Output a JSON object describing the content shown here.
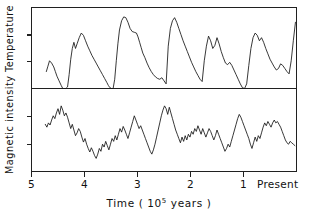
{
  "figure": {
    "background_color": "#ffffff",
    "line_color": "#151515",
    "axis_color": "#202020"
  },
  "axes": {
    "ylabel": "Magnetic intensity  Temperature",
    "ylabel_parts": {
      "lower_panel": "Magnetic intensity",
      "upper_panel": "Temperature"
    },
    "xlabel_prefix": "Time ( 10",
    "xlabel_exponent": "5",
    "xlabel_suffix": " years )",
    "xlabel_full": "Time ( 10^5 years )",
    "xticklabels": [
      "5",
      "4",
      "3",
      "2",
      "1",
      "Present"
    ],
    "xtickvalues": [
      5,
      4,
      3,
      2,
      1,
      0
    ],
    "x_direction": "decreasing-left-to-right",
    "yticks_count_upper": 2,
    "yticks_count_lower": 2,
    "ytick_labels": []
  },
  "chart_data": {
    "type": "line",
    "title": "",
    "subtitle": "",
    "xlabel": "Time ( 10^5 years )",
    "ylabel": "Magnetic intensity  Temperature",
    "xlim": [
      5.0,
      0.0
    ],
    "grid": false,
    "legend": "none",
    "panels": [
      {
        "name": "temperature",
        "label": "Temperature",
        "position": "top",
        "ylabel": "Temperature",
        "ylim": [
          0,
          1
        ],
        "yticks": [
          0.33,
          0.66
        ],
        "ytick_labels": [],
        "units": "relative (arbitrary)",
        "series": [
          {
            "name": "Temperature",
            "x": [
              4.72,
              4.69,
              4.66,
              4.62,
              4.58,
              4.55,
              4.52,
              4.48,
              4.44,
              4.41,
              4.38,
              4.35,
              4.32,
              4.29,
              4.26,
              4.23,
              4.2,
              4.17,
              4.14,
              4.1,
              4.06,
              4.02,
              3.98,
              3.94,
              3.9,
              3.86,
              3.82,
              3.78,
              3.74,
              3.7,
              3.66,
              3.62,
              3.58,
              3.55,
              3.52,
              3.49,
              3.46,
              3.43,
              3.4,
              3.37,
              3.34,
              3.3,
              3.26,
              3.22,
              3.18,
              3.14,
              3.1,
              3.06,
              3.02,
              2.99,
              2.96,
              2.93,
              2.9,
              2.86,
              2.82,
              2.78,
              2.74,
              2.7,
              2.66,
              2.62,
              2.58,
              2.54,
              2.5,
              2.46,
              2.42,
              2.38,
              2.34,
              2.3,
              2.26,
              2.22,
              2.18,
              2.14,
              2.1,
              2.06,
              2.02,
              1.98,
              1.94,
              1.9,
              1.86,
              1.82,
              1.78,
              1.74,
              1.7,
              1.66,
              1.62,
              1.58,
              1.54,
              1.5,
              1.46,
              1.42,
              1.38,
              1.34,
              1.3,
              1.26,
              1.22,
              1.18,
              1.14,
              1.1,
              1.06,
              1.02,
              0.98,
              0.94,
              0.9,
              0.86,
              0.82,
              0.78,
              0.74,
              0.7,
              0.66,
              0.62,
              0.58,
              0.54,
              0.5,
              0.46,
              0.42,
              0.38,
              0.34,
              0.3,
              0.26,
              0.22,
              0.18,
              0.14,
              0.1,
              0.06,
              0.02
            ],
            "y": [
              0.22,
              0.29,
              0.36,
              0.33,
              0.28,
              0.22,
              0.16,
              0.1,
              0.04,
              0.0,
              0.0,
              0.0,
              0.02,
              0.18,
              0.38,
              0.52,
              0.6,
              0.52,
              0.58,
              0.66,
              0.72,
              0.69,
              0.62,
              0.55,
              0.49,
              0.43,
              0.38,
              0.33,
              0.28,
              0.23,
              0.18,
              0.13,
              0.08,
              0.04,
              0.01,
              0.0,
              0.0,
              0.12,
              0.36,
              0.58,
              0.76,
              0.88,
              0.93,
              0.92,
              0.86,
              0.78,
              0.74,
              0.73,
              0.72,
              0.67,
              0.6,
              0.53,
              0.46,
              0.4,
              0.33,
              0.27,
              0.22,
              0.18,
              0.15,
              0.13,
              0.12,
              0.14,
              0.1,
              0.06,
              0.55,
              0.78,
              0.88,
              0.92,
              0.86,
              0.78,
              0.7,
              0.62,
              0.55,
              0.48,
              0.41,
              0.34,
              0.28,
              0.22,
              0.17,
              0.12,
              0.09,
              0.36,
              0.55,
              0.68,
              0.62,
              0.52,
              0.56,
              0.66,
              0.58,
              0.48,
              0.4,
              0.33,
              0.31,
              0.34,
              0.3,
              0.24,
              0.18,
              0.12,
              0.06,
              0.01,
              0.0,
              0.06,
              0.3,
              0.52,
              0.66,
              0.72,
              0.69,
              0.62,
              0.66,
              0.6,
              0.52,
              0.45,
              0.38,
              0.33,
              0.28,
              0.24,
              0.26,
              0.32,
              0.3,
              0.26,
              0.22,
              0.19,
              0.36,
              0.62,
              0.86
            ]
          }
        ]
      },
      {
        "name": "magnetic_intensity",
        "label": "Magnetic intensity",
        "position": "bottom",
        "ylabel": "Magnetic intensity",
        "ylim": [
          0,
          1
        ],
        "yticks": [
          0.33,
          0.66
        ],
        "ytick_labels": [],
        "units": "relative (arbitrary)",
        "series": [
          {
            "name": "Magnetic intensity",
            "x": [
              4.74,
              4.71,
              4.68,
              4.65,
              4.62,
              4.59,
              4.56,
              4.53,
              4.5,
              4.47,
              4.44,
              4.41,
              4.38,
              4.35,
              4.32,
              4.29,
              4.26,
              4.23,
              4.2,
              4.17,
              4.14,
              4.11,
              4.08,
              4.05,
              4.02,
              3.99,
              3.96,
              3.93,
              3.9,
              3.87,
              3.84,
              3.81,
              3.78,
              3.75,
              3.72,
              3.69,
              3.66,
              3.63,
              3.6,
              3.57,
              3.54,
              3.51,
              3.48,
              3.45,
              3.42,
              3.39,
              3.36,
              3.33,
              3.3,
              3.27,
              3.24,
              3.21,
              3.18,
              3.15,
              3.12,
              3.09,
              3.06,
              3.03,
              3.0,
              2.97,
              2.94,
              2.91,
              2.88,
              2.85,
              2.82,
              2.79,
              2.76,
              2.73,
              2.7,
              2.67,
              2.64,
              2.61,
              2.58,
              2.55,
              2.52,
              2.49,
              2.46,
              2.43,
              2.4,
              2.37,
              2.34,
              2.31,
              2.28,
              2.25,
              2.22,
              2.19,
              2.16,
              2.13,
              2.1,
              2.07,
              2.04,
              2.01,
              1.98,
              1.95,
              1.92,
              1.89,
              1.86,
              1.83,
              1.8,
              1.77,
              1.74,
              1.71,
              1.68,
              1.65,
              1.62,
              1.59,
              1.56,
              1.53,
              1.5,
              1.47,
              1.44,
              1.41,
              1.38,
              1.35,
              1.32,
              1.29,
              1.26,
              1.23,
              1.2,
              1.17,
              1.14,
              1.11,
              1.08,
              1.05,
              1.02,
              0.99,
              0.96,
              0.93,
              0.9,
              0.87,
              0.84,
              0.81,
              0.78,
              0.75,
              0.72,
              0.69,
              0.66,
              0.63,
              0.6,
              0.57,
              0.54,
              0.51,
              0.48,
              0.45,
              0.42,
              0.39,
              0.36,
              0.33,
              0.3,
              0.27,
              0.24,
              0.21,
              0.18,
              0.15,
              0.12,
              0.09,
              0.06,
              0.03
            ],
            "y": [
              0.58,
              0.54,
              0.6,
              0.57,
              0.64,
              0.7,
              0.66,
              0.74,
              0.8,
              0.72,
              0.84,
              0.78,
              0.7,
              0.74,
              0.68,
              0.6,
              0.52,
              0.58,
              0.5,
              0.42,
              0.46,
              0.52,
              0.48,
              0.4,
              0.33,
              0.38,
              0.3,
              0.24,
              0.19,
              0.25,
              0.2,
              0.14,
              0.1,
              0.16,
              0.24,
              0.2,
              0.3,
              0.26,
              0.34,
              0.28,
              0.22,
              0.3,
              0.38,
              0.34,
              0.42,
              0.36,
              0.44,
              0.52,
              0.47,
              0.55,
              0.5,
              0.44,
              0.38,
              0.46,
              0.54,
              0.62,
              0.7,
              0.64,
              0.58,
              0.52,
              0.56,
              0.5,
              0.44,
              0.38,
              0.32,
              0.26,
              0.2,
              0.16,
              0.22,
              0.3,
              0.4,
              0.5,
              0.6,
              0.7,
              0.78,
              0.84,
              0.8,
              0.72,
              0.82,
              0.74,
              0.66,
              0.58,
              0.5,
              0.44,
              0.38,
              0.32,
              0.4,
              0.34,
              0.42,
              0.36,
              0.44,
              0.4,
              0.48,
              0.44,
              0.52,
              0.48,
              0.56,
              0.5,
              0.44,
              0.52,
              0.46,
              0.4,
              0.46,
              0.52,
              0.48,
              0.42,
              0.36,
              0.42,
              0.5,
              0.44,
              0.38,
              0.32,
              0.26,
              0.2,
              0.24,
              0.3,
              0.26,
              0.34,
              0.42,
              0.5,
              0.58,
              0.66,
              0.72,
              0.68,
              0.62,
              0.56,
              0.5,
              0.44,
              0.38,
              0.3,
              0.24,
              0.32,
              0.4,
              0.34,
              0.42,
              0.38,
              0.46,
              0.54,
              0.6,
              0.56,
              0.62,
              0.58,
              0.54,
              0.6,
              0.64,
              0.6,
              0.62,
              0.58,
              0.54,
              0.48,
              0.42,
              0.36,
              0.32,
              0.3,
              0.34,
              0.32,
              0.3,
              0.28
            ]
          }
        ]
      }
    ]
  }
}
